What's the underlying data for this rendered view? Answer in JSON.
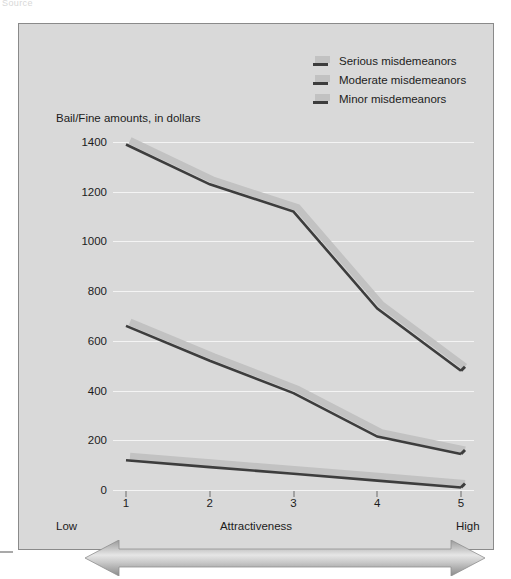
{
  "top_caption": "Source",
  "legend": {
    "position": "top-right",
    "items": [
      {
        "label": "Serious misdemeanors",
        "line_color": "#3d3d3d",
        "band_color": "#c2c2c2"
      },
      {
        "label": "Moderate misdemeanors",
        "line_color": "#3d3d3d",
        "band_color": "#c2c2c2"
      },
      {
        "label": "Minor misdemeanors",
        "line_color": "#3d3d3d",
        "band_color": "#c2c2c2"
      }
    ]
  },
  "axis_labels": {
    "y_title": "Bail/Fine amounts, in dollars",
    "x_title": "Attractiveness",
    "x_low": "Low",
    "x_high": "High"
  },
  "colors": {
    "figure_background": "#d9d9d9",
    "frame_border": "#8a8a8a",
    "gridline": "#f4f4f4",
    "line": "#3d3d3d",
    "band": "#c2c2c2",
    "text": "#1c1c1c",
    "arrow_dark": "#8d8d8d",
    "arrow_light": "#dedede"
  },
  "chart_data": {
    "type": "line",
    "title": "",
    "subtitle": "",
    "xlabel": "Attractiveness",
    "ylabel": "Bail/Fine amounts, in dollars",
    "categories": [
      "1",
      "2",
      "3",
      "4",
      "5"
    ],
    "x_tick_labels": [
      "1",
      "2",
      "3",
      "4",
      "5"
    ],
    "x_axis_endpoints": [
      "Low",
      "High"
    ],
    "y_tick_labels": [
      "0",
      "200",
      "400",
      "600",
      "800",
      "1000",
      "1200",
      "1400"
    ],
    "y_ticks": [
      0,
      200,
      400,
      600,
      800,
      1000,
      1200,
      1400
    ],
    "ylim": [
      0,
      1450
    ],
    "grid": true,
    "legend_position": "top-right",
    "series": [
      {
        "name": "Serious misdemeanors",
        "values": [
          1390,
          1230,
          1120,
          730,
          480
        ]
      },
      {
        "name": "Moderate misdemeanors",
        "values": [
          660,
          520,
          390,
          215,
          145
        ]
      },
      {
        "name": "Minor misdemeanors",
        "values": [
          120,
          92,
          65,
          38,
          10
        ]
      }
    ]
  },
  "range_arrow": {
    "name": "low-to-high-range-arrow",
    "direction": "double"
  }
}
